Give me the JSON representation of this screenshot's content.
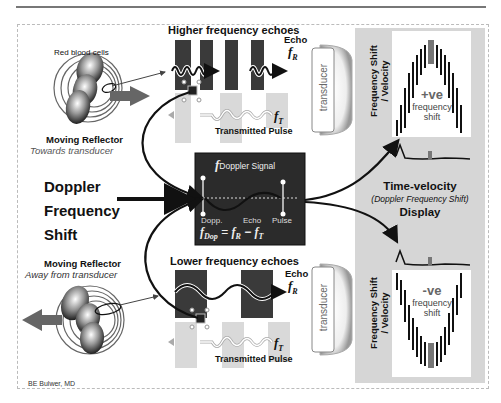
{
  "title_area": {
    "credit": "BE Bulwer, MD"
  },
  "top_reflector": {
    "cells_label": "Red blood cells",
    "label": "Moving Reflector",
    "sublabel": "Towards transducer"
  },
  "bottom_reflector": {
    "label": "Moving Reflector",
    "sublabel": "Away from transducer"
  },
  "top_echo": {
    "heading": "Higher frequency echoes",
    "echo_label": "Echo",
    "echo_symbol": "f",
    "echo_sub": "R",
    "tx_symbol": "f",
    "tx_sub": "T",
    "pulse_label": "Transmitted Pulse"
  },
  "bottom_echo": {
    "heading": "Lower frequency echoes",
    "echo_label": "Echo",
    "echo_symbol": "f",
    "echo_sub": "R",
    "tx_symbol": "f",
    "tx_sub": "T",
    "pulse_label": "Transmitted Pulse"
  },
  "transducer": {
    "label": "transducer"
  },
  "center_label": {
    "line1": "Doppler",
    "line2": "Frequency",
    "line3": "Shift"
  },
  "signal_box": {
    "title_symbol": "f",
    "title_sub": "Doppler Signal",
    "eq_label_1": "Dopp.",
    "eq_label_2": "Echo",
    "eq_label_3": "Pulse",
    "eq_sym_1": "f",
    "eq_sub_1": "Dop",
    "eq_equals": "=",
    "eq_sym_2": "f",
    "eq_sub_2": "R",
    "eq_minus": "−",
    "eq_sym_3": "f",
    "eq_sub_3": "T"
  },
  "display_panel": {
    "axis_label_1": "Frequency Shift",
    "axis_label_2": "/ Velocity",
    "title": "Time-velocity",
    "subtitle": "(Doppler Frequency Shift)",
    "title2": "Display",
    "positive": {
      "sign": "+ve",
      "line1": "frequency",
      "line2": "shift"
    },
    "negative": {
      "sign": "-ve",
      "line1": "frequency",
      "line2": "shift"
    }
  },
  "colors": {
    "dark_bar": "#3a3a3a",
    "light_bar": "#d9d9d9",
    "panel": "#d6d6d6",
    "box": "#2b2b2b",
    "accent_bar": "#777777"
  }
}
